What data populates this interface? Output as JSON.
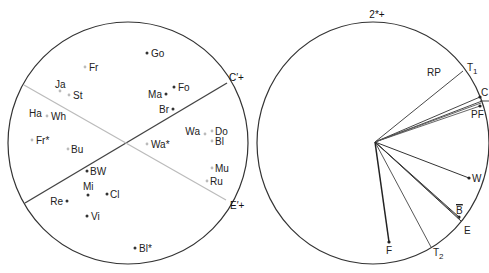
{
  "left_diagram": {
    "circle": {
      "cx": 128,
      "cy": 143,
      "rx": 120,
      "ry": 121
    },
    "axes": [
      {
        "name": "C'+",
        "label": "C′+",
        "x1": 25,
        "y1": 203,
        "x2": 227,
        "y2": 83,
        "color": "#444444",
        "width": 1.4,
        "label_x": 229,
        "label_y": 81
      },
      {
        "name": "E'+",
        "label": "E′+",
        "x1": 24,
        "y1": 85,
        "x2": 226,
        "y2": 200,
        "color": "#bbbbbb",
        "width": 1.2,
        "label_x": 230,
        "label_y": 209
      }
    ],
    "points": [
      {
        "label": "Go",
        "x": 147,
        "y": 53,
        "tone": "dark",
        "lx": 151,
        "ly": 57,
        "anchor": "start"
      },
      {
        "label": "Fr",
        "x": 85,
        "y": 67,
        "tone": "light",
        "lx": 89,
        "ly": 71,
        "anchor": "start"
      },
      {
        "label": "Ja",
        "x": 60,
        "y": 91,
        "tone": "light",
        "lx": 55,
        "ly": 88,
        "anchor": "start"
      },
      {
        "label": "St",
        "x": 69,
        "y": 95,
        "tone": "light",
        "lx": 73,
        "ly": 99,
        "anchor": "start"
      },
      {
        "label": "Fo",
        "x": 174,
        "y": 87,
        "tone": "dark",
        "lx": 178,
        "ly": 91,
        "anchor": "start"
      },
      {
        "label": "Ma",
        "x": 166,
        "y": 94,
        "tone": "dark",
        "lx": 162,
        "ly": 98,
        "anchor": "end"
      },
      {
        "label": "Br",
        "x": 173,
        "y": 109,
        "tone": "dark",
        "lx": 169,
        "ly": 113,
        "anchor": "end"
      },
      {
        "label": "Ha",
        "x": 29,
        "y": 116,
        "tone": "none",
        "lx": 29,
        "ly": 117,
        "anchor": "start"
      },
      {
        "label": "Wh",
        "x": 47,
        "y": 116,
        "tone": "light",
        "lx": 51,
        "ly": 120,
        "anchor": "start"
      },
      {
        "label": "Wa",
        "x": 205,
        "y": 134,
        "tone": "light",
        "lx": 200,
        "ly": 135,
        "anchor": "end"
      },
      {
        "label": "Do",
        "x": 212,
        "y": 131,
        "tone": "light",
        "lx": 215,
        "ly": 135,
        "anchor": "start"
      },
      {
        "label": "Fr*",
        "x": 32,
        "y": 140,
        "tone": "light",
        "lx": 36,
        "ly": 144,
        "anchor": "start"
      },
      {
        "label": "Bu",
        "x": 68,
        "y": 149,
        "tone": "light",
        "lx": 71,
        "ly": 153,
        "anchor": "start"
      },
      {
        "label": "Wa*",
        "x": 147,
        "y": 144,
        "tone": "light",
        "lx": 151,
        "ly": 148,
        "anchor": "start"
      },
      {
        "label": "Bl",
        "x": 212,
        "y": 141,
        "tone": "light",
        "lx": 215,
        "ly": 145,
        "anchor": "start"
      },
      {
        "label": "BW",
        "x": 87,
        "y": 171,
        "tone": "dark",
        "lx": 90,
        "ly": 175,
        "anchor": "start"
      },
      {
        "label": "Mu",
        "x": 212,
        "y": 168,
        "tone": "light",
        "lx": 215,
        "ly": 172,
        "anchor": "start"
      },
      {
        "label": "Ru",
        "x": 207,
        "y": 181,
        "tone": "light",
        "lx": 210,
        "ly": 185,
        "anchor": "start"
      },
      {
        "label": "Mi",
        "x": 88,
        "y": 195,
        "tone": "dark",
        "lx": 83,
        "ly": 190,
        "anchor": "start"
      },
      {
        "label": "Cl",
        "x": 107,
        "y": 194,
        "tone": "dark",
        "lx": 110,
        "ly": 198,
        "anchor": "start"
      },
      {
        "label": "Re",
        "x": 67,
        "y": 201,
        "tone": "dark",
        "lx": 63,
        "ly": 205,
        "anchor": "end"
      },
      {
        "label": "Vi",
        "x": 87,
        "y": 216,
        "tone": "dark",
        "lx": 91,
        "ly": 220,
        "anchor": "start"
      },
      {
        "label": "Bl*",
        "x": 135,
        "y": 248,
        "tone": "dark",
        "lx": 139,
        "ly": 252,
        "anchor": "start"
      }
    ]
  },
  "right_diagram": {
    "circle": {
      "cx": 373,
      "cy": 143,
      "rx": 116,
      "ry": 121
    },
    "top_label": "2*+",
    "top_label_pos": {
      "x": 377,
      "y": 18
    },
    "origin": {
      "x": 375,
      "y": 142
    },
    "vectors": [
      {
        "name": "T1",
        "x": 463,
        "y": 71,
        "color": "#333333",
        "width": 0.9,
        "dot": false
      },
      {
        "name": "C",
        "x": 480,
        "y": 97,
        "color": "#333333",
        "width": 0.9,
        "dot": true
      },
      {
        "name": "C2",
        "x": 482,
        "y": 101,
        "color": "#333333",
        "width": 0.9,
        "dot": false
      },
      {
        "name": "PF1",
        "x": 481,
        "y": 103,
        "color": "#555555",
        "width": 0.9,
        "dot": false
      },
      {
        "name": "PF",
        "x": 480,
        "y": 106,
        "color": "#555555",
        "width": 0.9,
        "dot": true
      },
      {
        "name": "W",
        "x": 469,
        "y": 178,
        "color": "#333333",
        "width": 1.0,
        "dot": true
      },
      {
        "name": "B",
        "x": 459,
        "y": 217,
        "color": "#333333",
        "width": 1.0,
        "dot": true
      },
      {
        "name": "B2",
        "x": 460,
        "y": 219,
        "color": "#555555",
        "width": 0.9,
        "dot": false
      },
      {
        "name": "E",
        "x": 461,
        "y": 221,
        "color": "#333333",
        "width": 1.0,
        "dot": false
      },
      {
        "name": "T2",
        "x": 431,
        "y": 247,
        "color": "#444444",
        "width": 0.9,
        "dot": false
      },
      {
        "name": "F",
        "x": 389,
        "y": 242,
        "color": "#222222",
        "width": 1.5,
        "dot": true
      }
    ],
    "tick": {
      "x1": 480,
      "y1": 101,
      "x2": 489,
      "y2": 101
    },
    "labels": [
      {
        "text": "RP",
        "x": 441,
        "y": 76,
        "anchor": "end"
      },
      {
        "text": "T",
        "sub": "1",
        "x": 467,
        "y": 71,
        "anchor": "start"
      },
      {
        "text": "C",
        "x": 481,
        "y": 96,
        "anchor": "start"
      },
      {
        "text": "PF",
        "x": 471,
        "y": 118,
        "anchor": "start"
      },
      {
        "text": "W",
        "x": 472,
        "y": 182,
        "anchor": "start"
      },
      {
        "text": "B",
        "overbar": true,
        "x": 456,
        "y": 214,
        "anchor": "start"
      },
      {
        "text": "E",
        "x": 464,
        "y": 234,
        "anchor": "start"
      },
      {
        "text": "F",
        "x": 386,
        "y": 254,
        "anchor": "start"
      },
      {
        "text": "T",
        "sub": "2",
        "x": 433,
        "y": 256,
        "anchor": "start"
      }
    ]
  }
}
